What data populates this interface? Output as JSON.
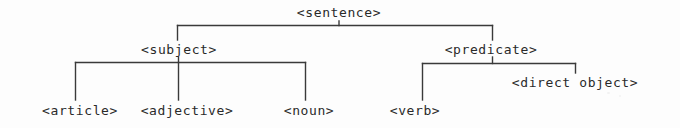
{
  "figure": {
    "kind": "parse-tree-diagram",
    "background_color": "#fdfdfd",
    "line_color": "#3a3a3a",
    "text_color": "#2a2a2a",
    "width": 680,
    "height": 128
  },
  "nodes": {
    "sentence": {
      "label": "<sentence>",
      "x": 339,
      "y": 6
    },
    "subject": {
      "label": "<subject>",
      "x": 179,
      "y": 43
    },
    "predicate": {
      "label": "<predicate>",
      "x": 491,
      "y": 43
    },
    "article": {
      "label": "<article>",
      "x": 80,
      "y": 104
    },
    "adjective": {
      "label": "<adjective>",
      "x": 187,
      "y": 104
    },
    "noun": {
      "label": "<noun>",
      "x": 309,
      "y": 104
    },
    "verb": {
      "label": "<verb>",
      "x": 415,
      "y": 104
    },
    "direct_object": {
      "label": "<direct object>",
      "x": 575,
      "y": 76
    }
  },
  "edges": [
    {
      "from": "sentence",
      "to": "subject",
      "name": "edge-sentence-subject"
    },
    {
      "from": "sentence",
      "to": "predicate",
      "name": "edge-sentence-predicate"
    },
    {
      "from": "subject",
      "to": "article",
      "name": "edge-subject-article"
    },
    {
      "from": "subject",
      "to": "adjective",
      "name": "edge-subject-adjective"
    },
    {
      "from": "subject",
      "to": "noun",
      "name": "edge-subject-noun"
    },
    {
      "from": "predicate",
      "to": "verb",
      "name": "edge-predicate-verb"
    },
    {
      "from": "predicate",
      "to": "direct_object",
      "name": "edge-predicate-direct-object"
    }
  ]
}
